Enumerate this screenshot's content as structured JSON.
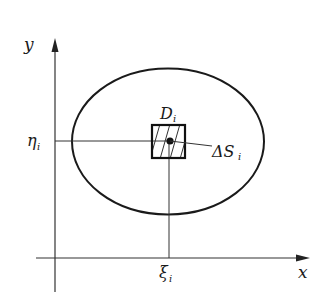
{
  "diagram": {
    "type": "double-integral-region-partition",
    "axes": {
      "x_label": "x",
      "y_label": "y"
    },
    "region": {
      "shape": "ellipse",
      "label_main": "D",
      "label_sub": "i"
    },
    "subregion": {
      "shape": "hatched-square",
      "area_label_main": "ΔS",
      "area_label_sub": "i"
    },
    "point": {
      "x_coord_main": "ξ",
      "x_coord_sub": "i",
      "y_coord_main": "η",
      "y_coord_sub": "i"
    },
    "colors": {
      "stroke": "#1a1a1a",
      "background": "#ffffff"
    }
  }
}
